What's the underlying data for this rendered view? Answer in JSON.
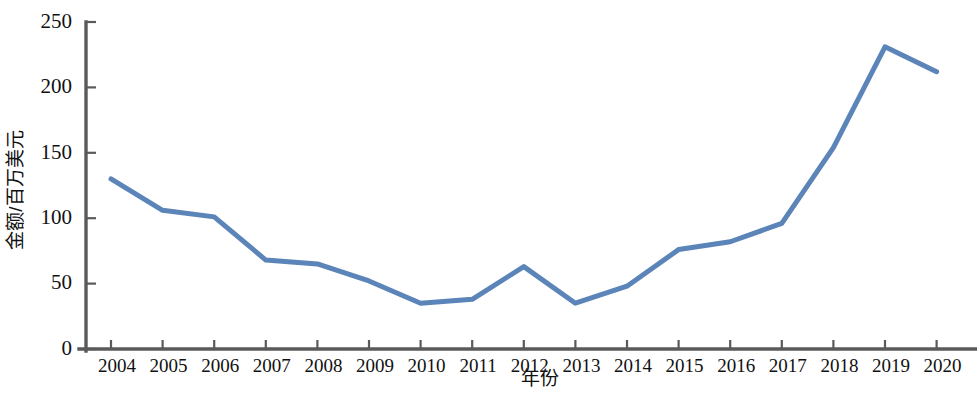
{
  "chart_data": {
    "type": "line",
    "title": "",
    "subtitle": "",
    "xlabel": "年份",
    "ylabel": "金额/百万美元",
    "categories": [
      "2004",
      "2005",
      "2006",
      "2007",
      "2008",
      "2009",
      "2010",
      "2011",
      "2012",
      "2013",
      "2014",
      "2015",
      "2016",
      "2017",
      "2018",
      "2019",
      "2020"
    ],
    "x": [
      2004,
      2005,
      2006,
      2007,
      2008,
      2009,
      2010,
      2011,
      2012,
      2013,
      2014,
      2015,
      2016,
      2017,
      2018,
      2019,
      2020
    ],
    "values": [
      130,
      106,
      101,
      68,
      65,
      52,
      35,
      38,
      63,
      35,
      48,
      76,
      82,
      96,
      154,
      231,
      212
    ],
    "series": [
      {
        "name": "金额",
        "values": [
          130,
          106,
          101,
          68,
          65,
          52,
          35,
          38,
          63,
          35,
          48,
          76,
          82,
          96,
          154,
          231,
          212
        ],
        "color": "#5b84b8"
      }
    ],
    "ylim": [
      0,
      250
    ],
    "yticks": [
      0,
      50,
      100,
      150,
      200,
      250
    ],
    "ytick_labels": [
      "0",
      "50",
      "100",
      "150",
      "200",
      "250"
    ],
    "xtick_labels": [
      "2004",
      "2005",
      "2006",
      "2007",
      "2008",
      "2009",
      "2010",
      "2011",
      "2012",
      "2013",
      "2014",
      "2015",
      "2016",
      "2017",
      "2018",
      "2019",
      "2020"
    ],
    "grid": false,
    "legend": false,
    "legend_position": "none",
    "line_color": "#5b84b8",
    "axis_color": "#5a5a5a",
    "background": "#ffffff",
    "line_width": 5
  }
}
